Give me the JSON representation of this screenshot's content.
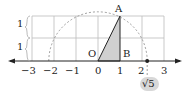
{
  "diagram": {
    "type": "number-line-construction",
    "tick_labels": [
      "−3",
      "−2",
      "−1",
      "0",
      "1",
      "2",
      "3"
    ],
    "grid_height_labels": [
      "1",
      "1"
    ],
    "points": {
      "A": "A",
      "B": "B",
      "O": "O"
    },
    "result_label": "√5",
    "colors": {
      "grid": "#bbbbbb",
      "triangle_fill": "#d0d0d0",
      "arc": "#888888",
      "axis": "#222222",
      "badge": "#d8d8d8"
    }
  }
}
